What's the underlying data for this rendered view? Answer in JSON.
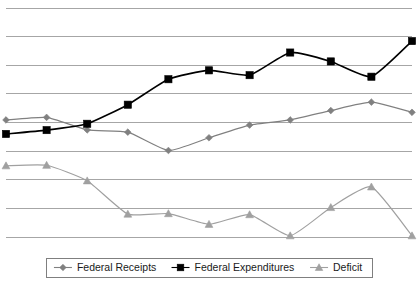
{
  "chart_data": {
    "type": "line",
    "title": "",
    "subtitle": "",
    "xlabel": "",
    "ylabel": "",
    "grid": true,
    "gridlines_count": 9,
    "legend_position": "bottom",
    "x": [
      1,
      2,
      3,
      4,
      5,
      6,
      7,
      8,
      9,
      10,
      11
    ],
    "xtick_labels": [],
    "ytick_labels": [],
    "ylim": [
      0,
      9
    ],
    "series": [
      {
        "name": "Federal Receipts",
        "color": "#808080",
        "marker": "diamond",
        "values": [
          4.6,
          4.7,
          4.21,
          4.12,
          3.4,
          3.9,
          4.4,
          4.6,
          4.97,
          5.3,
          4.9
        ]
      },
      {
        "name": "Federal Expenditures",
        "color": "#000000",
        "marker": "square",
        "values": [
          4.05,
          4.2,
          4.45,
          5.2,
          6.2,
          6.55,
          6.36,
          7.25,
          6.9,
          6.3,
          7.7
        ]
      },
      {
        "name": "Deficit",
        "color": "#a0a0a0",
        "marker": "triangle",
        "values": [
          2.8,
          2.82,
          2.21,
          0.9,
          0.92,
          0.5,
          0.88,
          0.05,
          1.16,
          1.97,
          0.05
        ]
      }
    ]
  },
  "legend": {
    "items": [
      {
        "label": "Federal Receipts",
        "color": "#808080",
        "marker": "diamond"
      },
      {
        "label": "Federal Expenditures",
        "color": "#000000",
        "marker": "square"
      },
      {
        "label": "Deficit",
        "color": "#a0a0a0",
        "marker": "triangle"
      }
    ]
  },
  "plot_geometry": {
    "left": 6,
    "right": 412,
    "top": 8,
    "bottom": 237,
    "grid_top": 8,
    "grid_spacing": 28.625
  }
}
